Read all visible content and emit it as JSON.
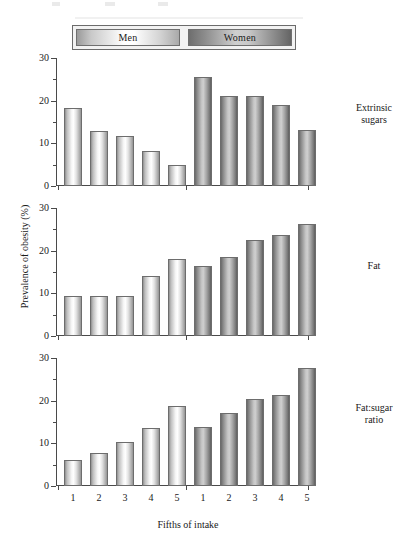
{
  "chart_data": {
    "type": "bar",
    "title": "",
    "xlabel": "Fifths of intake",
    "ylabel": "Prevalence of obesity (%)",
    "ylim": [
      0,
      30
    ],
    "yticks": [
      0,
      10,
      20,
      30
    ],
    "yticks_minor": [
      5,
      15,
      25
    ],
    "grid": false,
    "legend_position": "top",
    "categories": [
      "1",
      "2",
      "3",
      "4",
      "5"
    ],
    "legend": [
      "Men",
      "Women"
    ],
    "panels": [
      {
        "label_line1": "Extrinsic",
        "label_line2": "sugars",
        "series": [
          {
            "name": "Men",
            "values": [
              18.3,
              13.0,
              11.7,
              8.1,
              5.0
            ]
          },
          {
            "name": "Women",
            "values": [
              25.5,
              21.0,
              21.0,
              19.0,
              13.2
            ]
          }
        ]
      },
      {
        "label_line1": "Fat",
        "label_line2": "",
        "series": [
          {
            "name": "Men",
            "values": [
              9.3,
              9.3,
              9.3,
              14.0,
              18.0
            ]
          },
          {
            "name": "Women",
            "values": [
              16.3,
              18.6,
              22.4,
              23.7,
              26.2
            ]
          }
        ]
      },
      {
        "label_line1": "Fat:sugar",
        "label_line2": "ratio",
        "series": [
          {
            "name": "Men",
            "values": [
              6.0,
              7.8,
              10.3,
              13.7,
              18.8
            ]
          },
          {
            "name": "Women",
            "values": [
              13.9,
              17.2,
              20.3,
              21.3,
              27.6
            ]
          }
        ]
      }
    ]
  },
  "legend": {
    "men_label": "Men",
    "women_label": "Women"
  },
  "axes": {
    "y_title": "Prevalence of obesity (%)",
    "x_title": "Fifths of intake"
  },
  "panel_labels": [
    {
      "line1": "Extrinsic",
      "line2": "sugars"
    },
    {
      "line1": "Fat",
      "line2": ""
    },
    {
      "line1": "Fat:sugar",
      "line2": "ratio"
    }
  ],
  "colors": {
    "men_fill": "#f0f0f0",
    "women_fill": "#a8a8a8",
    "axis": "#4a4a4a",
    "text": "#1a1a1a",
    "background": "#ffffff"
  }
}
